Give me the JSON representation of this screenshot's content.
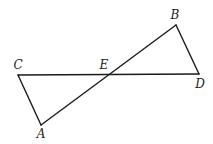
{
  "diagram": {
    "title": "",
    "points": [
      {
        "name": "A",
        "x": 41,
        "y": 125,
        "label_x": 41,
        "label_y": 138
      },
      {
        "name": "B",
        "x": 176,
        "y": 25,
        "label_x": 175,
        "label_y": 19
      },
      {
        "name": "C",
        "x": 18,
        "y": 75,
        "label_x": 18,
        "label_y": 69
      },
      {
        "name": "D",
        "x": 199,
        "y": 74,
        "label_x": 200,
        "label_y": 88
      },
      {
        "name": "E",
        "x": 106,
        "y": 74,
        "label_x": 104,
        "label_y": 69
      }
    ],
    "segments": [
      {
        "from": "C",
        "to": "D"
      },
      {
        "from": "A",
        "to": "B"
      },
      {
        "from": "C",
        "to": "A"
      },
      {
        "from": "B",
        "to": "D"
      }
    ],
    "labels": {
      "A": "A",
      "B": "B",
      "C": "C",
      "D": "D",
      "E": "E"
    },
    "line_color": "#1a1a1a"
  }
}
